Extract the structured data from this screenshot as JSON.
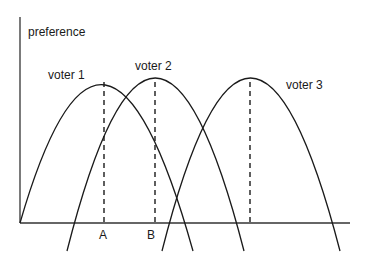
{
  "diagram": {
    "y_axis_label": "preference",
    "x_ticks": [
      {
        "label": "A",
        "x": 104
      },
      {
        "label": "B",
        "x": 155
      }
    ],
    "voters": [
      {
        "label": "voter 1",
        "peak_x": 104,
        "peak_y": 78,
        "label_x": 48,
        "label_y": 79
      },
      {
        "label": "voter 2",
        "peak_x": 155,
        "peak_y": 78,
        "label_x": 135,
        "label_y": 70
      },
      {
        "label": "voter 3",
        "peak_x": 250,
        "peak_y": 78,
        "label_x": 286,
        "label_y": 89
      }
    ],
    "axis": {
      "origin_x": 20,
      "origin_y": 223,
      "x_end": 350,
      "y_top": 17
    },
    "line_color": "#1a1a1a"
  }
}
